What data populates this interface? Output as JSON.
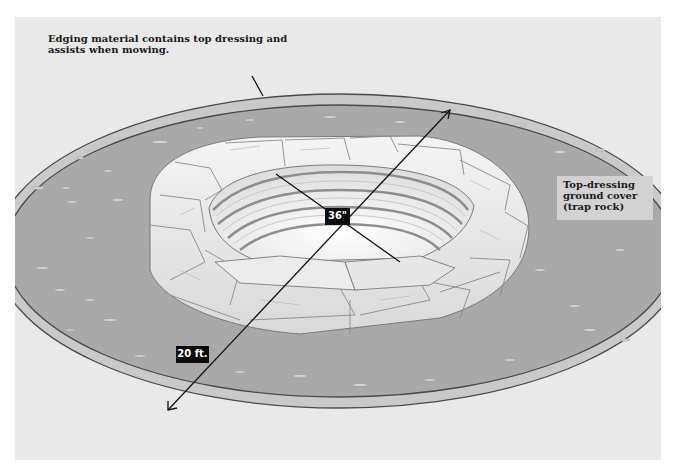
{
  "diagram": {
    "callouts": {
      "edging": "Edging material contains top dressing and assists when mowing.",
      "top_dressing_line1": "Top-dressing",
      "top_dressing_line2": "ground cover",
      "top_dressing_line3": "(trap rock)"
    },
    "dimensions": {
      "pit_diameter": "36\"",
      "area_diameter": "20 ft."
    },
    "colors": {
      "background": "#ffffff",
      "panel": "#e9e9e9",
      "gravel": "#a9a9a9",
      "edging": "#c9c9c9",
      "edging_outline": "#4a4a4a",
      "stone": "#ececec",
      "stone_outline": "#7a7a7a",
      "dimension_tag": "#0a0a0a"
    }
  }
}
